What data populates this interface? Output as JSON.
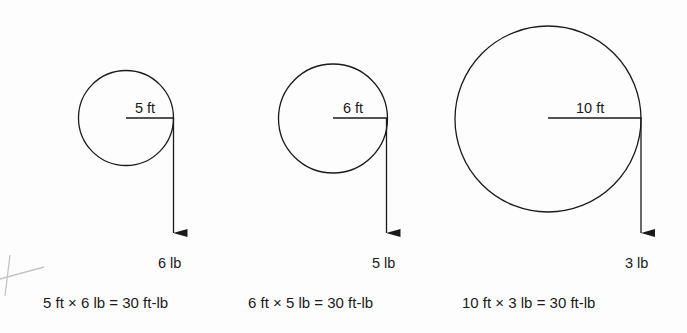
{
  "diagram": {
    "colors": {
      "ink": "#1a1a1a",
      "pencil": "#c4c4c4",
      "background": "#fdfdfd"
    },
    "wheels": [
      {
        "radius_label": "5 ft",
        "force_label": "6 lb",
        "equation": "5 ft × 6 lb = 30 ft-lb",
        "radius_ft": 5,
        "force_lb": 6,
        "torque_ftlb": 30
      },
      {
        "radius_label": "6 ft",
        "force_label": "5 lb",
        "equation": "6 ft × 5 lb = 30 ft-lb",
        "radius_ft": 6,
        "force_lb": 5,
        "torque_ftlb": 30
      },
      {
        "radius_label": "10 ft",
        "force_label": "3 lb",
        "equation": "10 ft × 3 lb = 30 ft-lb",
        "radius_ft": 10,
        "force_lb": 3,
        "torque_ftlb": 30
      }
    ],
    "annotations": [
      {
        "type": "pencil-cross-mark"
      }
    ]
  }
}
